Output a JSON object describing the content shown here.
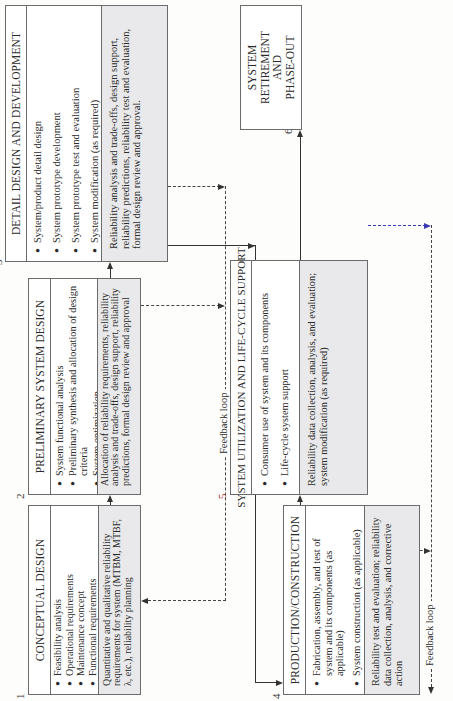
{
  "diagram": {
    "orientation": "rotated 90 degrees counter-clockwise",
    "stages": [
      {
        "number": "1",
        "title": "CONCEPTUAL DESIGN",
        "bullets": [
          "Feasibility analysis",
          "Operational requirements",
          "Maintenance concept",
          "Functional requirements",
          "Technical performance measures",
          "Advance system planning"
        ],
        "reliability_note": "Quantitative and qualitative reliability requirements for system (MTBM, MTBF, λ, etc.), reliability planning"
      },
      {
        "number": "2",
        "title": "PRELIMINARY SYSTEM DESIGN",
        "bullets": [
          "System functional analysis",
          "Preliminary synthesis and allocation of design criteria",
          "System optimization",
          "System synthesis and definition"
        ],
        "reliability_note": "Allocation of reliability requirements, reliability analysis and trade-offs, design support, reliability predictions, formal design review and approval"
      },
      {
        "number": "3",
        "title": "DETAIL DESIGN AND DEVELOPMENT",
        "bullets": [
          "System/product detail design",
          "System prototype development",
          "System prototype test and evaluation",
          "System modification (as required)"
        ],
        "reliability_note": "Reliability analysis and trade-offs, design support, reliability predictions, reliability test and evaluation, formal design review and approval."
      },
      {
        "number": "4",
        "title": "PRODUCTION/CONSTRUCTION",
        "bullets": [
          "Fabrication, assembly, and test of system and its components (as applicable)",
          "System construction (as applicable)"
        ],
        "reliability_note": "Reliability test and evaluation; reliability data collection, analysis, and corrective action"
      },
      {
        "number": "5",
        "title": "SYSTEM UTILIZATION AND LIFE-CYCLE SUPPORT",
        "bullets": [
          "Consumer use of system and its components",
          "Life-cycle system support"
        ],
        "reliability_note": "Reliability data collection, analysis, and evaluation; system modification (as required)"
      },
      {
        "number": "6",
        "title_lines": [
          "SYSTEM",
          "RETIREMENT",
          "AND",
          "PHASE-OUT"
        ]
      }
    ],
    "feedback_labels": {
      "upper": "Feedback loop",
      "lower": "Feedback loop"
    },
    "colors": {
      "box_border": "#6b6b6b",
      "reliability_panel": "#e9e9eb",
      "line": "#333333",
      "blue_dash": "#3a3ab0"
    }
  }
}
